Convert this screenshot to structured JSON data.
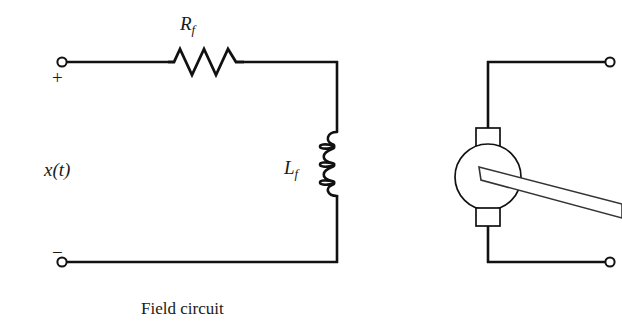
{
  "diagram": {
    "title": "Field circuit",
    "caption": "Field circuit",
    "background_color": "#ffffff",
    "line_color": "#111111",
    "labels": {
      "resistor": {
        "symbol": "R",
        "subscript": "f",
        "full": "Rf"
      },
      "inductor": {
        "symbol": "L",
        "subscript": "f",
        "full": "Lf"
      },
      "source": {
        "text": "x(t)"
      },
      "polarity_positive": "+",
      "polarity_negative": "−"
    },
    "components": [
      {
        "name": "resistor",
        "type": "resistor",
        "label": "Rf",
        "orientation": "horizontal"
      },
      {
        "name": "inductor",
        "type": "inductor",
        "label": "Lf",
        "orientation": "vertical",
        "coils": 3
      },
      {
        "name": "armature",
        "type": "motor-armature",
        "label": "",
        "brushes": 2
      },
      {
        "name": "shaft",
        "type": "rotor-shaft",
        "label": ""
      }
    ],
    "terminals": [
      {
        "name": "terminal-positive",
        "polarity": "+",
        "x": 62,
        "y": 62
      },
      {
        "name": "terminal-negative",
        "polarity": "−",
        "x": 62,
        "y": 262
      },
      {
        "name": "terminal-motor-top",
        "polarity": "",
        "x": 610,
        "y": 62
      },
      {
        "name": "terminal-motor-bottom",
        "polarity": "",
        "x": 610,
        "y": 262
      }
    ]
  }
}
